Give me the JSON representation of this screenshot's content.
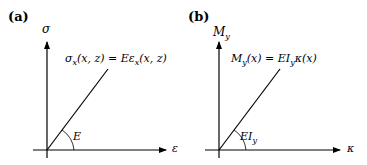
{
  "panels": [
    {
      "id": "a",
      "label": "(a)",
      "y_axis": "σ",
      "x_axis": "ε",
      "equation": "σx(x, z) = Eεx(x, z)",
      "equation_parts": {
        "lhs_base": "σ",
        "lhs_sub": "x",
        "lhs_args": "(x, z) = ",
        "rhs_E": "E",
        "rhs_base": "ε",
        "rhs_sub": "x",
        "rhs_args": "(x, z)"
      },
      "slope_label": "E"
    },
    {
      "id": "b",
      "label": "(b)",
      "y_axis": "My",
      "y_axis_parts": {
        "base": "M",
        "sub": "y"
      },
      "x_axis": "κ",
      "equation": "My(x) = EIyκ(x)",
      "equation_parts": {
        "lhs_base": "M",
        "lhs_sub": "y",
        "lhs_args": "(x) = ",
        "rhs_EI": "EI",
        "rhs_sub": "y",
        "rhs_rest": "κ(x)"
      },
      "slope_label": "EIy",
      "slope_label_parts": {
        "base": "EI",
        "sub": "y"
      }
    }
  ]
}
